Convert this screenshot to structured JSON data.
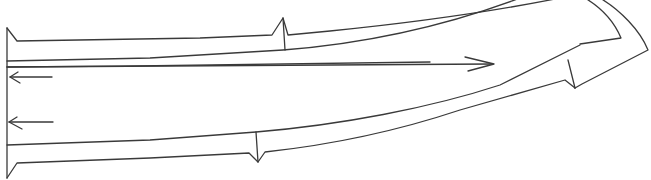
{
  "diagram": {
    "type": "hand-drawn line sketch",
    "colors": {
      "background": "#ffffff",
      "line": "#3a3a3a"
    },
    "elements": {
      "left_boundary": "vertical line at left edge",
      "upper_strip": "curved band along the top, with notch marker near x≈283 and wrapping down around the right end",
      "lower_strip": "curved band along the bottom, with notch markers near x≈258 and x≈575",
      "arrows": [
        {
          "direction": "left",
          "label": "upper left arrow"
        },
        {
          "direction": "left",
          "label": "lower left arrow"
        },
        {
          "direction": "right",
          "label": "long right arrow"
        }
      ]
    },
    "caption_partial": "(text cut off at top edge, illegible)"
  }
}
